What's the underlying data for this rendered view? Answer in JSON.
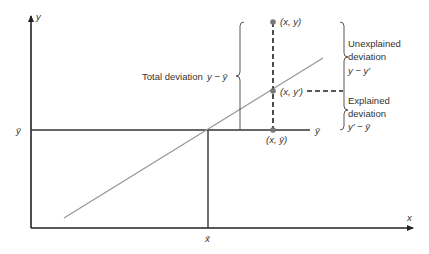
{
  "diagram": {
    "axes": {
      "x_label": "x",
      "y_label": "y",
      "x_mean_label": "x̄",
      "y_mean_label": "ȳ"
    },
    "points": {
      "observed": "(x, y)",
      "predicted": "(x, y′)",
      "mean": "(x, ȳ)"
    },
    "mean_line_label": "ȳ",
    "total_deviation": {
      "label": "Total deviation",
      "formula": "y − ȳ"
    },
    "unexplained_deviation": {
      "line1": "Unexplained",
      "line2": "deviation",
      "formula": "y − y′"
    },
    "explained_deviation": {
      "line1": "Explained",
      "line2": "deviation",
      "formula": "y′ − ȳ"
    },
    "colors": {
      "axis": "#222222",
      "regression_line": "#9a9a9a",
      "point": "#777777",
      "text": "#333333"
    }
  }
}
